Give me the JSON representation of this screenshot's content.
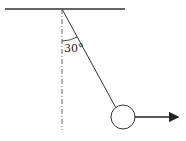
{
  "diagram": {
    "type": "pendulum-force",
    "angle_label": "30°",
    "elements": {
      "ceiling": "horizontal support line",
      "vertical_reference": "dashed vertical line",
      "string": "inclined string",
      "bob": "circle",
      "force_arrow": "horizontal arrow pointing right"
    },
    "colors": {
      "stroke": "#333333",
      "background": "#ffffff"
    }
  }
}
